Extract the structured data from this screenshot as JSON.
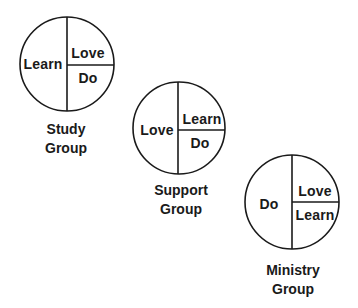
{
  "diagram": {
    "groups": [
      {
        "name": "study",
        "caption": [
          "Study",
          "Group"
        ],
        "left": "Learn",
        "top_right": "Love",
        "bottom_right": "Do",
        "cx": 67,
        "cy": 64,
        "r": 47,
        "hy": 65
      },
      {
        "name": "support",
        "caption": [
          "Support",
          "Group"
        ],
        "left": "Love",
        "top_right": "Learn",
        "bottom_right": "Do",
        "cx": 179,
        "cy": 128,
        "r": 46,
        "hy": 130
      },
      {
        "name": "ministry",
        "caption": [
          "Ministry",
          "Group"
        ],
        "left": "Do",
        "top_right": "Love",
        "bottom_right": "Learn",
        "cx": 292,
        "cy": 202,
        "r": 47,
        "hy": 202
      }
    ],
    "colors": {
      "stroke": "#1a1a1a",
      "background": "#ffffff"
    }
  }
}
